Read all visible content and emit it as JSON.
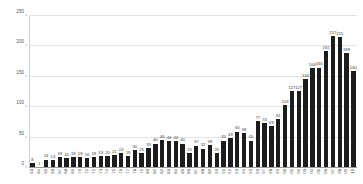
{
  "chart_data": {
    "type": "bar",
    "title": "",
    "xlabel": "",
    "ylabel": "",
    "ylim": [
      0,
      250
    ],
    "yticks": [
      0,
      50,
      100,
      150,
      200,
      250
    ],
    "grid": true,
    "legend": "none",
    "bar_color": "#1c1c1c",
    "show_value_labels": true,
    "categories": [
      "63",
      "64",
      "65",
      "66",
      "67",
      "68",
      "69",
      "70",
      "71",
      "72",
      "73",
      "74",
      "75",
      "76",
      "77",
      "78",
      "79",
      "80",
      "81",
      "82",
      "83",
      "84",
      "85",
      "86",
      "87",
      "88",
      "89",
      "90",
      "91",
      "92",
      "93",
      "94",
      "95",
      "96",
      "97",
      "98",
      "99",
      "00",
      "01",
      "02",
      "03",
      "04",
      "05",
      "06",
      "07",
      "08",
      "09",
      "10"
    ],
    "values": [
      8,
      1,
      14,
      13,
      18,
      16,
      18,
      18,
      16,
      18,
      19,
      20,
      21,
      24,
      19,
      30,
      25,
      33,
      40,
      46,
      44,
      44,
      40,
      25,
      37,
      32,
      38,
      25,
      45,
      49,
      60,
      58,
      45,
      77,
      74,
      69,
      81,
      103,
      127,
      127,
      146,
      164,
      165,
      192,
      217,
      215,
      189,
      160
    ]
  },
  "axis": {
    "y_tick_labels": [
      "0",
      "50",
      "100",
      "150",
      "200",
      "250"
    ],
    "x_tick_labels": [
      "63",
      "64",
      "65",
      "66",
      "67",
      "68",
      "69",
      "70",
      "71",
      "72",
      "73",
      "74",
      "75",
      "76",
      "77",
      "78",
      "79",
      "80",
      "81",
      "82",
      "83",
      "84",
      "85",
      "86",
      "87",
      "88",
      "89",
      "90",
      "91",
      "92",
      "93",
      "94",
      "95",
      "96",
      "97",
      "98",
      "99",
      "00",
      "01",
      "02",
      "03",
      "04",
      "05",
      "06",
      "07",
      "08",
      "09",
      "10"
    ]
  }
}
